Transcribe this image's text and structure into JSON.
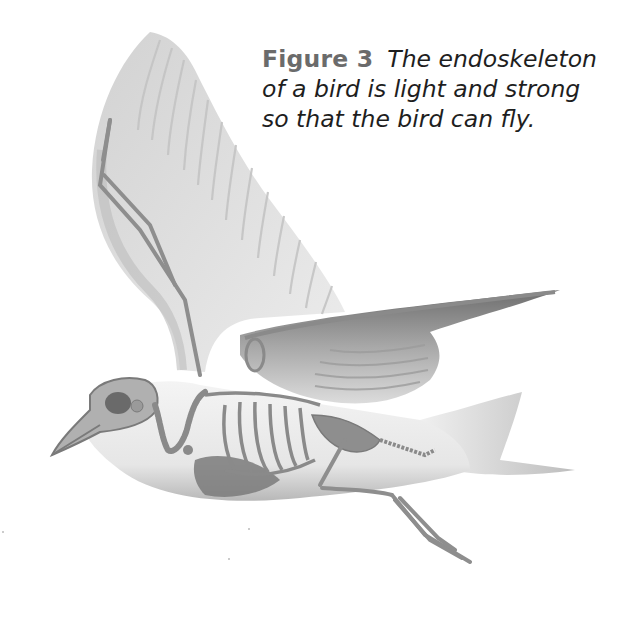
{
  "figure": {
    "label": "Figure 3",
    "caption": "The endoskeleton of a bird is light and strong so that the bird can fly.",
    "illustration": {
      "subject": "bird in flight with endoskeleton visible",
      "style": "grayscale anatomical drawing",
      "parts": [
        "skull",
        "beak",
        "neck vertebrae",
        "wing bones",
        "feathered wings",
        "rib cage",
        "keel/sternum",
        "pelvis",
        "tail",
        "legs and feet"
      ]
    },
    "colors": {
      "background": "#ffffff",
      "label": "#6b6b6b",
      "text": "#1e1e1e",
      "bone": "#9a9a9a",
      "feather": "#d9d9d9",
      "body": "#e8e8e8",
      "shadow": "#7a7a7a"
    }
  }
}
